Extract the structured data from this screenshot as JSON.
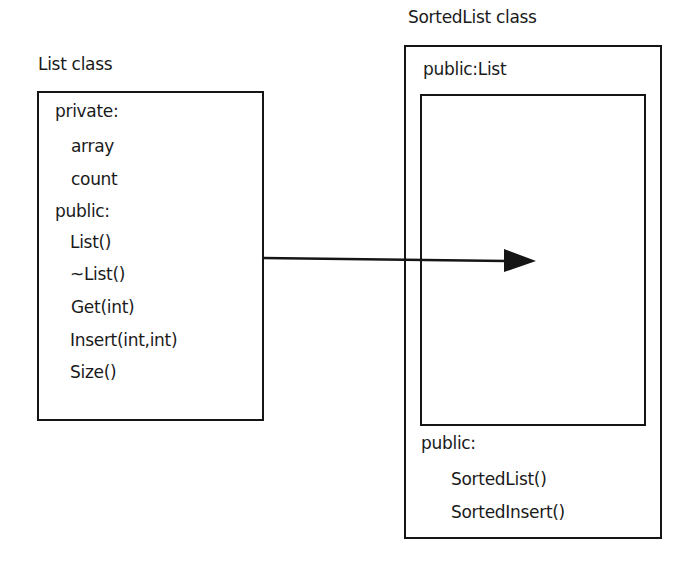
{
  "diagram": {
    "type": "class-inheritance",
    "colors": {
      "stroke": "#151515",
      "text": "#1a1a1a",
      "background": "#ffffff"
    },
    "list_class": {
      "title": "List class",
      "sections": [
        {
          "header": "private:",
          "members": [
            "array",
            "count"
          ]
        },
        {
          "header": "public:",
          "members": [
            "List()",
            "~List()",
            "Get(int)",
            "Insert(int,int)",
            "Size()"
          ]
        }
      ]
    },
    "sorted_list_class": {
      "title": "SortedList class",
      "inherits_label": "public:List",
      "sections": [
        {
          "header": "public:",
          "members": [
            "SortedList()",
            "SortedInsert()"
          ]
        }
      ]
    },
    "arrow": {
      "from": "List class",
      "to": "SortedList class (embedded public:List)",
      "meaning": "inheritance"
    }
  }
}
